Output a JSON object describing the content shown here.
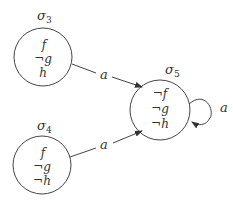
{
  "diagram": {
    "type": "state-transition",
    "colors": {
      "stroke": "#444444",
      "text": "#333333",
      "background": "#ffffff"
    },
    "states": [
      {
        "id": "s3",
        "name": "σ",
        "sub": "3",
        "props": [
          "f",
          "¬g",
          "h"
        ]
      },
      {
        "id": "s4",
        "name": "σ",
        "sub": "4",
        "props": [
          "f",
          "¬g",
          "¬h"
        ]
      },
      {
        "id": "s5",
        "name": "σ",
        "sub": "5",
        "props": [
          "¬f",
          "¬g",
          "¬h"
        ]
      }
    ],
    "transitions": [
      {
        "from": "s3",
        "to": "s5",
        "label": "a"
      },
      {
        "from": "s4",
        "to": "s5",
        "label": "a"
      },
      {
        "from": "s5",
        "to": "s5",
        "label": "a"
      }
    ]
  }
}
